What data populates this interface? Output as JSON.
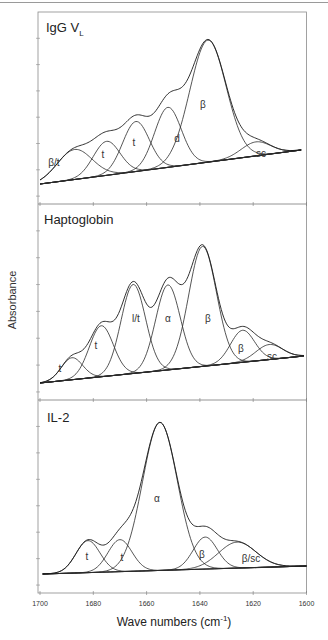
{
  "chart_data": {
    "type": "line",
    "title": "",
    "xlabel": "Wave numbers (cm-1)",
    "xlabel_parts": {
      "base": "Wave numbers (cm",
      "sup": "-1",
      "close": ")"
    },
    "ylabel": "Absorbance",
    "xlim": [
      1700,
      1600
    ],
    "x_reversed": true,
    "x_ticks": [
      1700,
      1680,
      1660,
      1640,
      1620,
      1600
    ],
    "grid": false,
    "layout": "3 vertically stacked panels sharing x-axis",
    "panels": [
      {
        "title": "IgG V",
        "title_sub": "L",
        "top_px": 12,
        "bottom_px": 204,
        "baseline": {
          "x1": 1700,
          "y1": 184,
          "x2": 1602,
          "y2": 150
        },
        "composite_peak_cm": 1641,
        "components": [
          {
            "label": "β/t",
            "center": 1687,
            "height_px": 30,
            "sigma": 6.5,
            "label_pos": [
              54,
              162
            ]
          },
          {
            "label": "t",
            "center": 1675,
            "height_px": 34,
            "sigma": 5.0,
            "label_pos": [
              103,
              154
            ]
          },
          {
            "label": "t",
            "center": 1664,
            "height_px": 50,
            "sigma": 5.0,
            "label_pos": [
              134,
              142
            ]
          },
          {
            "label": "d",
            "center": 1652,
            "height_px": 60,
            "sigma": 5.0,
            "label_pos": [
              177,
              138
            ]
          },
          {
            "label": "β",
            "center": 1637,
            "height_px": 122,
            "sigma": 6.8,
            "label_pos": [
              203,
              104
            ]
          },
          {
            "label": "sc",
            "center": 1619,
            "height_px": 14,
            "sigma": 5.5,
            "label_pos": [
              261,
              153
            ]
          }
        ]
      },
      {
        "title": "Haptoglobin",
        "title_sub": "",
        "top_px": 204,
        "bottom_px": 400,
        "baseline": {
          "x1": 1700,
          "y1": 383,
          "x2": 1601,
          "y2": 356
        },
        "composite_peak_cm": 1643,
        "components": [
          {
            "label": "t",
            "center": 1688,
            "height_px": 22,
            "sigma": 4.0,
            "label_pos": [
              60,
              368
            ]
          },
          {
            "label": "t",
            "center": 1677,
            "height_px": 51,
            "sigma": 4.5,
            "label_pos": [
              96,
              345
            ]
          },
          {
            "label": "l/t",
            "center": 1665,
            "height_px": 89,
            "sigma": 4.6,
            "label_pos": [
              136,
              318
            ]
          },
          {
            "label": "α",
            "center": 1652,
            "height_px": 85,
            "sigma": 4.6,
            "label_pos": [
              168,
              318
            ]
          },
          {
            "label": "β",
            "center": 1639,
            "height_px": 120,
            "sigma": 5.2,
            "label_pos": [
              208,
              318
            ]
          },
          {
            "label": "β",
            "center": 1624,
            "height_px": 32,
            "sigma": 4.5,
            "label_pos": [
              241,
              348
            ]
          },
          {
            "label": "sc",
            "center": 1614,
            "height_px": 15,
            "sigma": 5.0,
            "label_pos": [
              272,
              356
            ]
          }
        ]
      },
      {
        "title": "IL-2",
        "title_sub": "",
        "top_px": 400,
        "bottom_px": 593,
        "baseline": {
          "x1": 1699,
          "y1": 574,
          "x2": 1600,
          "y2": 566
        },
        "composite_peak_cm": 1655,
        "components": [
          {
            "label": "t",
            "center": 1682,
            "height_px": 32,
            "sigma": 4.5,
            "label_pos": [
              87,
              556
            ]
          },
          {
            "label": "t",
            "center": 1670,
            "height_px": 32,
            "sigma": 4.5,
            "label_pos": [
              122,
              557
            ]
          },
          {
            "label": "α",
            "center": 1655,
            "height_px": 148,
            "sigma": 6.5,
            "label_pos": [
              157,
              498
            ]
          },
          {
            "label": "β",
            "center": 1638,
            "height_px": 32,
            "sigma": 4.5,
            "label_pos": [
              202,
              554
            ]
          },
          {
            "label": "β/sc",
            "center": 1626,
            "height_px": 26,
            "sigma": 7.0,
            "label_pos": [
              251,
              558
            ]
          }
        ]
      }
    ]
  }
}
